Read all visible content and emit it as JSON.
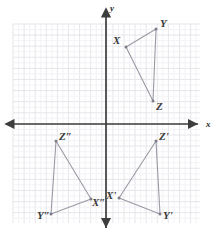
{
  "figure": {
    "type": "coordinate-plane-geometry",
    "background_color": "#ffffff",
    "grid": {
      "visible": true,
      "color": "#e3e3ea",
      "minor_color": "#eeeef3",
      "left": 13,
      "top": 24,
      "right": 200,
      "bottom": 223,
      "cell_size": 11.1
    },
    "axes": {
      "color": "#3d3d3d",
      "origin_x": 106,
      "origin_y": 124,
      "x_axis": {
        "label": "x",
        "label_x": 206,
        "label_y": 127,
        "from_x": 6,
        "to_x": 198
      },
      "y_axis": {
        "label": "y",
        "label_x": 110,
        "label_y": 11,
        "from_y": 9,
        "to_y": 228
      }
    },
    "triangles": [
      {
        "name": "triangle-XYZ",
        "stroke": "#9a9aa5",
        "vertices": [
          {
            "label": "X",
            "px": 126,
            "py": 47,
            "label_x": 113,
            "label_y": 44
          },
          {
            "label": "Y",
            "px": 156,
            "py": 29,
            "label_x": 160,
            "label_y": 27
          },
          {
            "label": "Z",
            "px": 153,
            "py": 101,
            "label_x": 156,
            "label_y": 110
          }
        ]
      },
      {
        "name": "triangle-X-prime",
        "stroke": "#9a9aa5",
        "vertices": [
          {
            "label": "X'",
            "px": 119,
            "py": 198,
            "label_x": 106,
            "label_y": 199
          },
          {
            "label": "Y'",
            "px": 160,
            "py": 214,
            "label_x": 163,
            "label_y": 219
          },
          {
            "label": "Z'",
            "px": 156,
            "py": 141,
            "label_x": 159,
            "label_y": 140
          }
        ]
      },
      {
        "name": "triangle-X-double-prime",
        "stroke": "#9a9aa5",
        "vertices": [
          {
            "label": "X″",
            "px": 91,
            "py": 199,
            "label_x": 92,
            "label_y": 206
          },
          {
            "label": "Y″",
            "px": 51,
            "py": 214,
            "label_x": 37,
            "label_y": 219
          },
          {
            "label": "Z″",
            "px": 56,
            "py": 141,
            "label_x": 59,
            "label_y": 140
          }
        ]
      }
    ]
  }
}
